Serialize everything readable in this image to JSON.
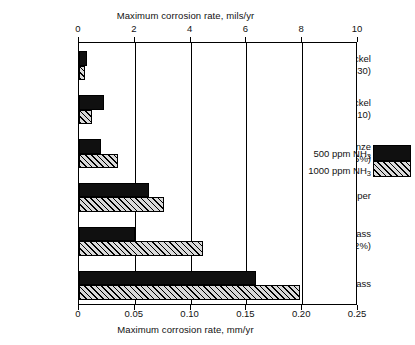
{
  "chart_data": {
    "type": "bar",
    "orientation": "horizontal",
    "title": "",
    "xlabel": "Maximum corrosion rate, mm/yr",
    "xlabel_top": "Maximum corrosion rate, mils/yr",
    "ylabel": "",
    "grid": true,
    "legend_position": "inside-upper-right",
    "xlim": [
      0,
      0.25
    ],
    "xlim_top": [
      0,
      10
    ],
    "xticks": [
      "0",
      "0.05",
      "0.10",
      "0.15",
      "0.20",
      "0.25"
    ],
    "xticks_top": [
      "0",
      "2",
      "4",
      "6",
      "8",
      "10"
    ],
    "xtick_values": [
      0,
      0.05,
      0.1,
      0.15,
      0.2,
      0.25
    ],
    "xtick_values_top": [
      0,
      2,
      4,
      6,
      8,
      10
    ],
    "categories": [
      "Copper-nickel (70-30)",
      "Copper-nickel (90-10)",
      "Aluminum bronze (5%)",
      "Arsenical copper",
      "Aluminum brass (2%)",
      "Admiralty brass"
    ],
    "category_labels": [
      {
        "line1": "Copper-nickel",
        "line2": "(70-30)"
      },
      {
        "line1": "Copper-nickel",
        "line2": "(90-10)"
      },
      {
        "line1": "Aluminum bronze",
        "line2": "(5%)"
      },
      {
        "line1": "Arsenical copper",
        "line2": ""
      },
      {
        "line1": "Aluminum brass",
        "line2": "(2%)"
      },
      {
        "line1": "Admiralty brass",
        "line2": ""
      }
    ],
    "series": [
      {
        "name": "500 ppm NH3",
        "name_html": "500 ppm NH<sub>3</sub>",
        "fill": "solid-black",
        "color": "#101010",
        "values": [
          0.007,
          0.022,
          0.02,
          0.063,
          0.05,
          0.159
        ],
        "values_mils": [
          0.28,
          0.87,
          0.79,
          2.48,
          1.97,
          6.26
        ]
      },
      {
        "name": "1000 ppm NH3",
        "name_html": "1000 ppm NH<sub>3</sub>",
        "fill": "diagonal-hatch",
        "color": "#d9d9d9",
        "values": [
          0.005,
          0.012,
          0.035,
          0.076,
          0.111,
          0.198
        ],
        "values_mils": [
          0.2,
          0.47,
          1.38,
          2.99,
          4.37,
          7.8
        ]
      }
    ],
    "units_note": "Top axis in mils/yr, bottom axis in mm/yr"
  },
  "legend": {
    "entries": [
      {
        "label": "500 ppm NH",
        "sub": "3"
      },
      {
        "label": "1000 ppm NH",
        "sub": "3"
      }
    ]
  }
}
